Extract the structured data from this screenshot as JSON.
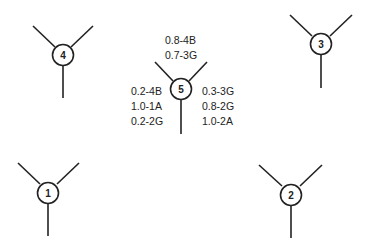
{
  "diagram": {
    "nodes": [
      {
        "id": "1",
        "label": "1"
      },
      {
        "id": "2",
        "label": "2"
      },
      {
        "id": "3",
        "label": "3"
      },
      {
        "id": "4",
        "label": "4"
      },
      {
        "id": "5",
        "label": "5"
      }
    ],
    "node5_annotations": {
      "top": [
        "0.8-4B",
        "0.7-3G"
      ],
      "left": [
        "0.2-4B",
        "1.0-1A",
        "0.2-2G"
      ],
      "right": [
        "0.3-3G",
        "0.8-2G",
        "1.0-2A"
      ]
    },
    "colors": {
      "stroke": "#222222",
      "background": "#ffffff"
    }
  }
}
